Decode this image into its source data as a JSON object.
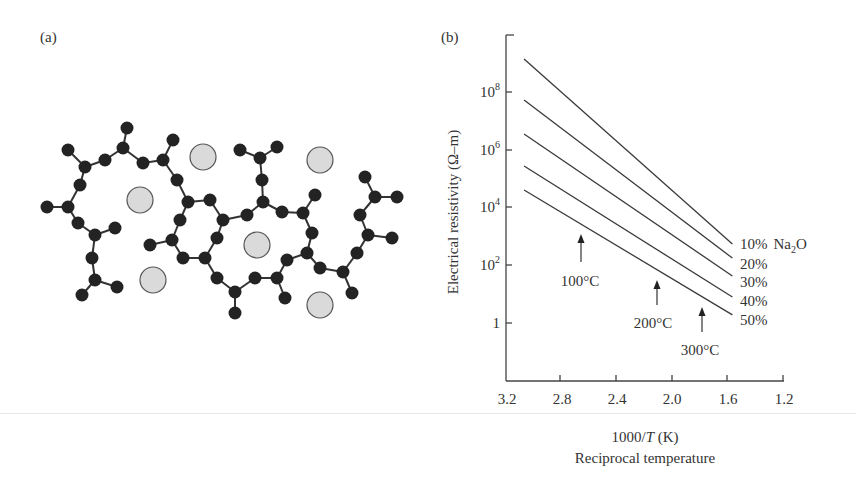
{
  "panel_a": {
    "label": "(a)",
    "description": "Schematic of sodium silicate glass network",
    "colors": {
      "network_atom": "#232323",
      "bond": "#333333",
      "ion_fill": "#dadada",
      "ion_stroke": "#555555"
    },
    "atoms": [
      [
        127,
        128
      ],
      [
        123,
        148
      ],
      [
        68,
        150
      ],
      [
        85,
        167
      ],
      [
        105,
        160
      ],
      [
        143,
        163
      ],
      [
        163,
        160
      ],
      [
        173,
        140
      ],
      [
        177,
        180
      ],
      [
        188,
        202
      ],
      [
        210,
        200
      ],
      [
        80,
        185
      ],
      [
        68,
        207
      ],
      [
        47,
        207
      ],
      [
        78,
        223
      ],
      [
        95,
        235
      ],
      [
        115,
        228
      ],
      [
        92,
        258
      ],
      [
        95,
        280
      ],
      [
        82,
        295
      ],
      [
        117,
        287
      ],
      [
        180,
        220
      ],
      [
        172,
        240
      ],
      [
        150,
        245
      ],
      [
        183,
        258
      ],
      [
        205,
        258
      ],
      [
        217,
        238
      ],
      [
        223,
        220
      ],
      [
        247,
        215
      ],
      [
        263,
        202
      ],
      [
        262,
        180
      ],
      [
        260,
        158
      ],
      [
        240,
        150
      ],
      [
        277,
        147
      ],
      [
        282,
        212
      ],
      [
        303,
        213
      ],
      [
        315,
        195
      ],
      [
        312,
        233
      ],
      [
        307,
        253
      ],
      [
        287,
        260
      ],
      [
        277,
        278
      ],
      [
        255,
        278
      ],
      [
        235,
        292
      ],
      [
        217,
        278
      ],
      [
        235,
        313
      ],
      [
        285,
        298
      ],
      [
        320,
        268
      ],
      [
        343,
        272
      ],
      [
        352,
        293
      ],
      [
        357,
        253
      ],
      [
        368,
        235
      ],
      [
        392,
        238
      ],
      [
        360,
        215
      ],
      [
        375,
        197
      ],
      [
        397,
        197
      ],
      [
        365,
        177
      ]
    ],
    "bonds": [
      [
        0,
        1
      ],
      [
        1,
        4
      ],
      [
        4,
        3
      ],
      [
        3,
        2
      ],
      [
        3,
        11
      ],
      [
        11,
        12
      ],
      [
        12,
        13
      ],
      [
        12,
        14
      ],
      [
        14,
        15
      ],
      [
        15,
        16
      ],
      [
        15,
        17
      ],
      [
        17,
        18
      ],
      [
        18,
        19
      ],
      [
        18,
        20
      ],
      [
        1,
        5
      ],
      [
        5,
        6
      ],
      [
        6,
        7
      ],
      [
        6,
        8
      ],
      [
        8,
        9
      ],
      [
        9,
        10
      ],
      [
        9,
        21
      ],
      [
        21,
        22
      ],
      [
        22,
        23
      ],
      [
        22,
        24
      ],
      [
        24,
        25
      ],
      [
        25,
        26
      ],
      [
        26,
        27
      ],
      [
        27,
        10
      ],
      [
        27,
        28
      ],
      [
        28,
        29
      ],
      [
        29,
        30
      ],
      [
        30,
        31
      ],
      [
        31,
        32
      ],
      [
        31,
        33
      ],
      [
        29,
        34
      ],
      [
        34,
        35
      ],
      [
        35,
        36
      ],
      [
        35,
        37
      ],
      [
        37,
        38
      ],
      [
        38,
        39
      ],
      [
        39,
        40
      ],
      [
        40,
        41
      ],
      [
        41,
        42
      ],
      [
        42,
        43
      ],
      [
        43,
        25
      ],
      [
        42,
        44
      ],
      [
        40,
        45
      ],
      [
        38,
        46
      ],
      [
        46,
        47
      ],
      [
        47,
        48
      ],
      [
        47,
        49
      ],
      [
        49,
        50
      ],
      [
        50,
        51
      ],
      [
        50,
        52
      ],
      [
        52,
        53
      ],
      [
        53,
        54
      ],
      [
        53,
        55
      ]
    ],
    "ions": [
      {
        "x": 203,
        "y": 157,
        "r": 13
      },
      {
        "x": 140,
        "y": 200,
        "r": 13
      },
      {
        "x": 320,
        "y": 160,
        "r": 13
      },
      {
        "x": 257,
        "y": 245,
        "r": 13
      },
      {
        "x": 153,
        "y": 280,
        "r": 13
      },
      {
        "x": 320,
        "y": 305,
        "r": 13
      }
    ]
  },
  "panel_b": {
    "label": "(b)",
    "y_axis_title": "Electrical resistivity (Ω–m)",
    "x_axis_title_prefix": "1000/",
    "x_axis_title_var": "T",
    "x_axis_title_suffix": " (K)",
    "x_axis_subtitle": "Reciprocal temperature",
    "y_tick_labels": [
      {
        "base": "10",
        "exp": "8"
      },
      {
        "base": "10",
        "exp": "6"
      },
      {
        "base": "10",
        "exp": "4"
      },
      {
        "base": "10",
        "exp": "2"
      },
      {
        "base": "1",
        "exp": ""
      }
    ],
    "x_tick_labels": [
      "3.2",
      "2.8",
      "2.4",
      "2.0",
      "1.6",
      "1.2"
    ],
    "series_labels": [
      "10%",
      "20%",
      "30%",
      "40%",
      "50%"
    ],
    "legend_suffix_base": "Na",
    "legend_suffix_sub": "2",
    "legend_suffix_end": "O",
    "annotations": [
      "100°C",
      "200°C",
      "300°C"
    ],
    "line_color": "#3a3a3a"
  },
  "chart_data": {
    "type": "line",
    "title": "",
    "xlabel": "1000/T (K) — Reciprocal temperature",
    "ylabel": "Electrical resistivity (Ω–m)",
    "y_scale": "log10",
    "xlim": [
      3.2,
      1.2
    ],
    "ylim_log10": [
      -2.0,
      9.9
    ],
    "x_ticks": [
      3.2,
      2.8,
      2.4,
      2.0,
      1.6,
      1.2
    ],
    "y_ticks": [
      "1",
      "10^2",
      "10^4",
      "10^6",
      "10^8"
    ],
    "grid": false,
    "legend_position": "right, at line ends",
    "series": [
      {
        "name": "10% Na2O",
        "x": [
          3.07,
          1.57
        ],
        "log10_y": [
          9.15,
          2.74
        ]
      },
      {
        "name": "20% Na2O",
        "x": [
          3.07,
          1.57
        ],
        "log10_y": [
          7.73,
          2.25
        ]
      },
      {
        "name": "30% Na2O",
        "x": [
          3.07,
          1.57
        ],
        "log10_y": [
          6.55,
          1.63
        ]
      },
      {
        "name": "40% Na2O",
        "x": [
          3.07,
          1.57
        ],
        "log10_y": [
          5.44,
          0.9
        ]
      },
      {
        "name": "50% Na2O",
        "x": [
          3.07,
          1.57
        ],
        "log10_y": [
          4.61,
          0.28
        ]
      }
    ],
    "annotations": [
      {
        "text": "100°C",
        "x": 2.68,
        "arrow": "up"
      },
      {
        "text": "200°C",
        "x": 2.11,
        "arrow": "up"
      },
      {
        "text": "300°C",
        "x": 1.79,
        "arrow": "up"
      }
    ]
  }
}
